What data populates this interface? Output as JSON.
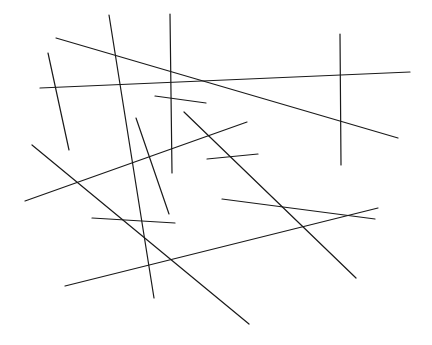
{
  "canvas": {
    "width": 432,
    "height": 345,
    "background": "#ffffff",
    "stroke_color": "#1a1a1a",
    "stroke_width": 1.2
  },
  "segments": [
    {
      "id": "seg-1",
      "x1": 109,
      "y1": 15,
      "x2": 154,
      "y2": 298
    },
    {
      "id": "seg-2",
      "x1": 170,
      "y1": 14,
      "x2": 172,
      "y2": 173
    },
    {
      "id": "seg-3",
      "x1": 56,
      "y1": 38,
      "x2": 398,
      "y2": 138
    },
    {
      "id": "seg-4",
      "x1": 40,
      "y1": 88,
      "x2": 410,
      "y2": 72
    },
    {
      "id": "seg-5",
      "x1": 48,
      "y1": 53,
      "x2": 69,
      "y2": 150
    },
    {
      "id": "seg-6",
      "x1": 340,
      "y1": 34,
      "x2": 341,
      "y2": 165
    },
    {
      "id": "seg-7",
      "x1": 155,
      "y1": 96,
      "x2": 206,
      "y2": 103
    },
    {
      "id": "seg-8",
      "x1": 184,
      "y1": 112,
      "x2": 356,
      "y2": 278
    },
    {
      "id": "seg-9",
      "x1": 25,
      "y1": 201,
      "x2": 247,
      "y2": 122
    },
    {
      "id": "seg-10",
      "x1": 136,
      "y1": 118,
      "x2": 169,
      "y2": 214
    },
    {
      "id": "seg-11",
      "x1": 207,
      "y1": 159,
      "x2": 258,
      "y2": 154
    },
    {
      "id": "seg-12",
      "x1": 32,
      "y1": 145,
      "x2": 249,
      "y2": 324
    },
    {
      "id": "seg-13",
      "x1": 92,
      "y1": 218,
      "x2": 175,
      "y2": 223
    },
    {
      "id": "seg-14",
      "x1": 222,
      "y1": 199,
      "x2": 375,
      "y2": 219
    },
    {
      "id": "seg-15",
      "x1": 65,
      "y1": 286,
      "x2": 378,
      "y2": 208
    }
  ]
}
